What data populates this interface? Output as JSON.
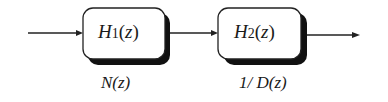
{
  "diagram": {
    "type": "block-diagram",
    "blocks": [
      {
        "id": "H1",
        "name": "H",
        "subscript": "1",
        "arg": "(z)",
        "caption": "N(z)"
      },
      {
        "id": "H2",
        "name": "H",
        "subscript": "2",
        "arg": "(z)",
        "caption": "1/ D(z)"
      }
    ],
    "connections": [
      {
        "from": "input",
        "to": "H1"
      },
      {
        "from": "H1",
        "to": "H2"
      },
      {
        "from": "H2",
        "to": "output"
      }
    ]
  }
}
